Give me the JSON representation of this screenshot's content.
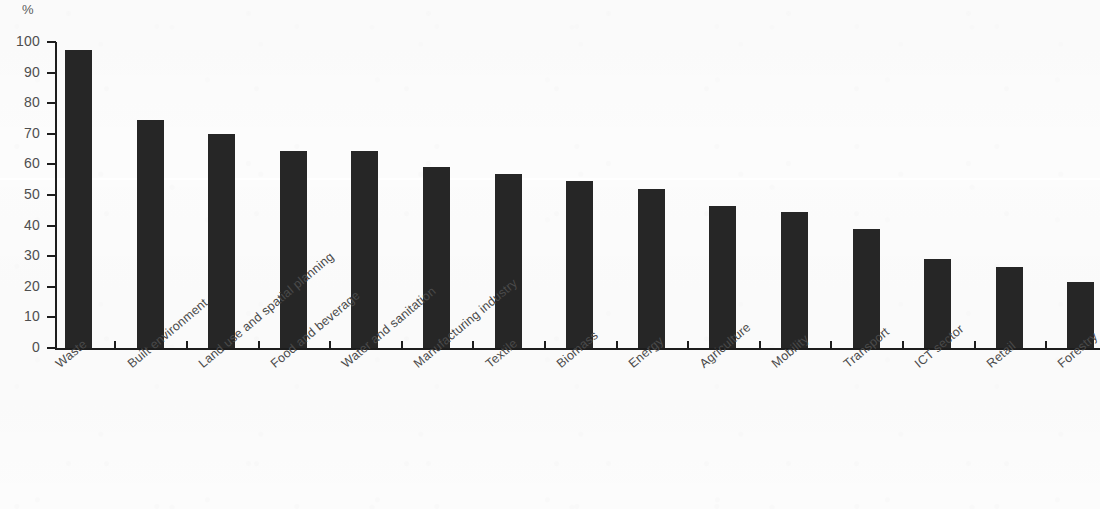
{
  "chart_data": {
    "type": "bar",
    "title": "",
    "subtitle": "",
    "xlabel": "",
    "ylabel": "%",
    "unit_caption": "%",
    "ylim": [
      0,
      100
    ],
    "y_ticks": [
      0,
      10,
      20,
      30,
      40,
      50,
      60,
      70,
      80,
      90,
      100
    ],
    "y_tick_labels": [
      "0",
      "10",
      "20",
      "30",
      "40",
      "50",
      "60",
      "70",
      "80",
      "90",
      "100"
    ],
    "grid": false,
    "legend": null,
    "legend_position": "none",
    "bar_color": "#262626",
    "axis_color": "#1d1d1d",
    "categories": [
      "Waste",
      "Built environment",
      "Land use and spatial planning",
      "Food and beverage",
      "Water and sanitation",
      "Manufacturing industry",
      "Textile",
      "Biomass",
      "Energy",
      "Agriculture",
      "Mobility",
      "Transport",
      "ICT sector",
      "Retail",
      "Forestry"
    ],
    "values": [
      97.5,
      74.5,
      70.0,
      64.5,
      64.5,
      59.0,
      57.0,
      54.5,
      52.0,
      46.5,
      44.5,
      39.0,
      29.0,
      26.5,
      21.5
    ]
  }
}
